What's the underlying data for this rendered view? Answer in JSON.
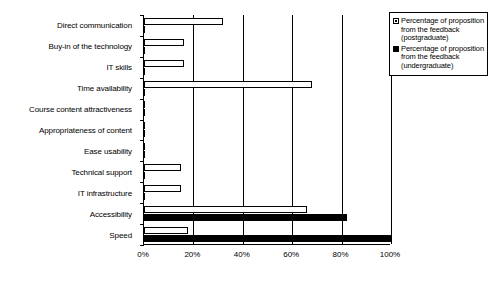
{
  "chart_data": {
    "type": "bar",
    "orientation": "horizontal",
    "title": "",
    "xlabel": "",
    "ylabel": "",
    "xlim": [
      0,
      100
    ],
    "xticks": [
      "0%",
      "20%",
      "40%",
      "60%",
      "80%",
      "100%"
    ],
    "xtick_values": [
      0,
      20,
      40,
      60,
      80,
      100
    ],
    "grid": true,
    "legend_position": "top-right",
    "categories": [
      "Direct communication",
      "Buy-in of the technology",
      "IT skills",
      "Time availability",
      "Course content attractiveness",
      "Appropriateness of content",
      "Ease usability",
      "Technical support",
      "IT infrastructure",
      "Accessibility",
      "Speed"
    ],
    "series": [
      {
        "name": "Percentage of proposition from the feedback (postgraduate)",
        "color": "#ffffff",
        "values": [
          32,
          16,
          16,
          68,
          0,
          0,
          0,
          15,
          15,
          66,
          18
        ]
      },
      {
        "name": "Percentage of proposition from the feedback (undergraduate)",
        "color": "#000000",
        "values": [
          0,
          0,
          0,
          0,
          0,
          0,
          0,
          0,
          0,
          82,
          100
        ]
      }
    ]
  },
  "legend": {
    "entries": [
      {
        "marker": "white-square-icon",
        "label": "Percentage of proposition from the feedback (postgraduate)"
      },
      {
        "marker": "black-square-icon",
        "label": "Percentage of proposition from the feedback (undergraduate)"
      }
    ]
  }
}
